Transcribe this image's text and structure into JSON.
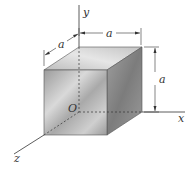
{
  "figure": {
    "type": "cube-on-axes",
    "labels": {
      "y_axis": "y",
      "x_axis": "x",
      "z_axis": "z",
      "origin": "O",
      "dim_top": "a",
      "dim_left": "a",
      "dim_right": "a"
    },
    "colors": {
      "front_face": "#b8b8b8",
      "top_face": "#d2d2d2",
      "right_face": "#8f8f8f",
      "lines": "#333333"
    }
  }
}
